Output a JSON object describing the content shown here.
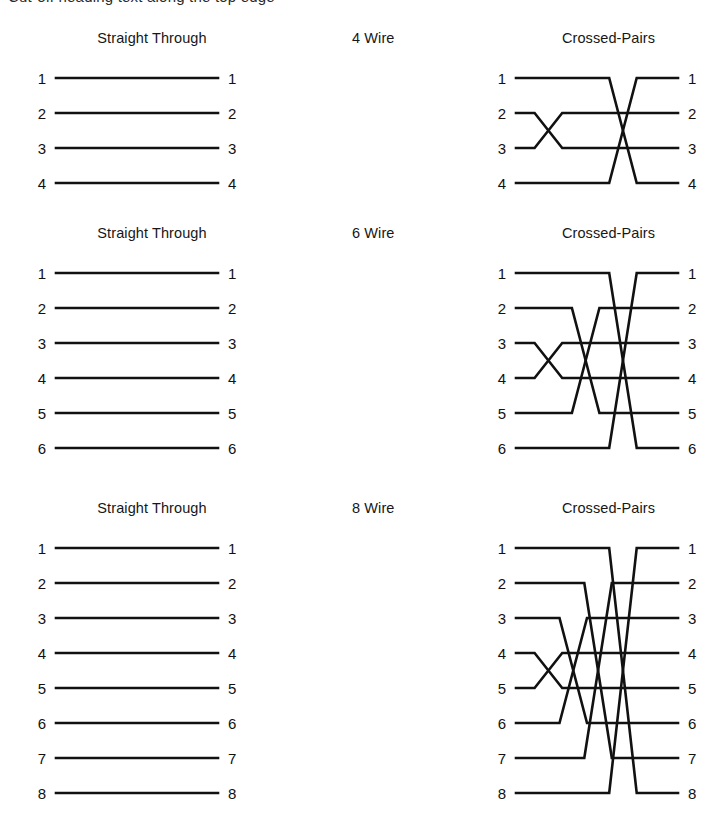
{
  "page": {
    "clipped_heading": "Cut-off heading text along the top edge",
    "line_color": "#111111",
    "background": "#ffffff"
  },
  "blocks": [
    {
      "id": "four-wire",
      "wire_count": 4,
      "left_title": "Straight Through",
      "middle_title": "4 Wire",
      "right_title": "Crossed-Pairs",
      "left_pins": [
        "1",
        "2",
        "3",
        "4"
      ],
      "right_pins": [
        "1",
        "2",
        "3",
        "4"
      ],
      "straight_map": [
        1,
        2,
        3,
        4
      ],
      "crossed_map": [
        4,
        3,
        2,
        1
      ]
    },
    {
      "id": "six-wire",
      "wire_count": 6,
      "left_title": "Straight Through",
      "middle_title": "6 Wire",
      "right_title": "Crossed-Pairs",
      "left_pins": [
        "1",
        "2",
        "3",
        "4",
        "5",
        "6"
      ],
      "right_pins": [
        "1",
        "2",
        "3",
        "4",
        "5",
        "6"
      ],
      "straight_map": [
        1,
        2,
        3,
        4,
        5,
        6
      ],
      "crossed_map": [
        6,
        5,
        4,
        3,
        2,
        1
      ]
    },
    {
      "id": "eight-wire",
      "wire_count": 8,
      "left_title": "Straight Through",
      "middle_title": "8 Wire",
      "right_title": "Crossed-Pairs",
      "left_pins": [
        "1",
        "2",
        "3",
        "4",
        "5",
        "6",
        "7",
        "8"
      ],
      "right_pins": [
        "1",
        "2",
        "3",
        "4",
        "5",
        "6",
        "7",
        "8"
      ],
      "straight_map": [
        1,
        2,
        3,
        4,
        5,
        6,
        7,
        8
      ],
      "crossed_map": [
        8,
        7,
        6,
        5,
        4,
        3,
        2,
        1
      ]
    }
  ],
  "geometry": {
    "row_pitch": 35,
    "first_row_y": 22,
    "block_tops": [
      30,
      225,
      500
    ],
    "straight_x_start": 34,
    "straight_x_end": 196,
    "crossed_x_start": 24,
    "crossed_x_end": 186,
    "label_gap": 10
  }
}
